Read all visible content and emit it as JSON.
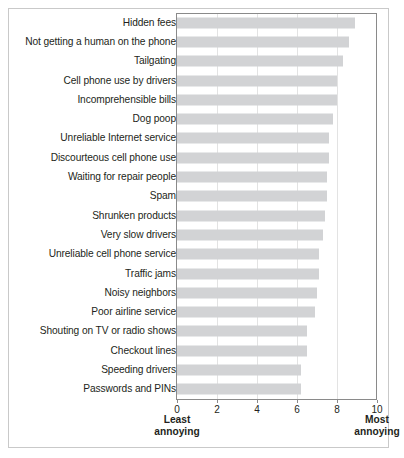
{
  "chart_data": {
    "type": "bar",
    "orientation": "horizontal",
    "title": "",
    "subtitle": "",
    "xlabel": "",
    "ylabel": "",
    "xlim": [
      0,
      10
    ],
    "grid": true,
    "legend": false,
    "axis_captions": {
      "left": [
        "Least",
        "annoying"
      ],
      "right": [
        "Most",
        "annoying"
      ]
    },
    "xticks": [
      0,
      2,
      4,
      6,
      8,
      10
    ],
    "xtick_labels": [
      "0",
      "2",
      "4",
      "6",
      "8",
      "10"
    ],
    "bar_color": "#d2d3d5",
    "categories": [
      "Hidden fees",
      "Not getting a human on the phone",
      "Tailgating",
      "Cell phone use by drivers",
      "Incomprehensible bills",
      "Dog poop",
      "Unreliable Internet service",
      "Discourteous cell phone use",
      "Waiting for repair people",
      "Spam",
      "Shrunken products",
      "Very slow drivers",
      "Unreliable cell phone service",
      "Traffic jams",
      "Noisy neighbors",
      "Poor airline service",
      "Shouting on TV or radio shows",
      "Checkout lines",
      "Speeding drivers",
      "Passwords and PINs"
    ],
    "values": [
      8.9,
      8.6,
      8.3,
      8.0,
      8.0,
      7.8,
      7.6,
      7.6,
      7.5,
      7.5,
      7.4,
      7.3,
      7.1,
      7.1,
      7.0,
      6.9,
      6.5,
      6.5,
      6.2,
      6.2
    ]
  }
}
